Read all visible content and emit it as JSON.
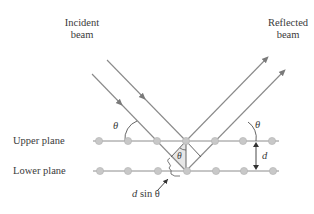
{
  "labels": {
    "incident_line1": "Incident",
    "incident_line2": "beam",
    "reflected_line1": "Reflected",
    "reflected_line2": "beam",
    "upper_plane": "Upper plane",
    "lower_plane": "Lower plane",
    "theta_left": "θ",
    "theta_right": "θ",
    "theta_center": "θ",
    "d": "d",
    "path_difference_d": "d",
    "path_difference_rest": " sin θ"
  },
  "colors": {
    "beam": "#8a8a8a",
    "plane_line": "#8c8c8c",
    "atom": "#c8c8c8",
    "atom_outline": "#b0b0b0",
    "text": "#3a3a3a",
    "triangle_fill": "#e6e6e6"
  },
  "geometry": {
    "upper_plane_y": 141,
    "lower_plane_y": 171,
    "atoms_x": [
      99,
      128,
      157,
      186,
      215,
      244,
      273
    ]
  }
}
